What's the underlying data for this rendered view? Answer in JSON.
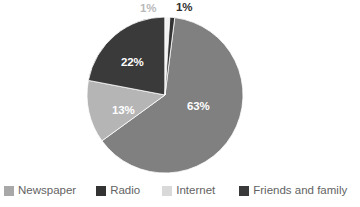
{
  "chart_data": {
    "type": "pie",
    "title": "",
    "subtitle": "",
    "xlabel": "",
    "ylabel": "",
    "grid": false,
    "legend_position": "bottom",
    "categories": [
      "Newspaper",
      "Radio",
      "Internet",
      "Friends and family"
    ],
    "values": [
      63,
      1,
      13,
      22
    ],
    "slice_order_clockwise_from_top": [
      "Newspaper",
      "Internet",
      "Friends and family",
      "Radio",
      "Other"
    ],
    "data_labels": [
      "63%",
      "1%",
      "13%",
      "22%",
      "1%"
    ],
    "colors": [
      "#808080",
      "#333333",
      "#b5b5b5",
      "#3a3a3a"
    ]
  },
  "pie": {
    "center_x": 165,
    "center_y": 95,
    "radius": 78,
    "slices": [
      {
        "name": "Newspaper",
        "percent": 63,
        "label": "63%",
        "color": "#808080",
        "start_deg": 7.2,
        "end_deg": 234.0
      },
      {
        "name": "Internet",
        "percent": 13,
        "label": "13%",
        "color": "#b5b5b5",
        "start_deg": 234.0,
        "end_deg": 280.8
      },
      {
        "name": "Friends and family",
        "percent": 22,
        "label": "22%",
        "color": "#3a3a3a",
        "start_deg": 280.8,
        "end_deg": 360.0
      },
      {
        "name": "Other",
        "percent": 1,
        "label": "1%",
        "color": "#f2f2f2",
        "start_deg": 0.0,
        "end_deg": 3.6
      },
      {
        "name": "Radio",
        "percent": 1,
        "label": "1%",
        "color": "#333333",
        "start_deg": 3.6,
        "end_deg": 7.2
      }
    ],
    "labels": {
      "newspaper": "63%",
      "friends": "22%",
      "internet": "13%",
      "radio_outside": "1%",
      "other_outside": "1%"
    }
  },
  "legend": {
    "items": [
      {
        "label": "Newspaper",
        "color": "#a8a8a8"
      },
      {
        "label": "Radio",
        "color": "#333333"
      },
      {
        "label": "Internet",
        "color": "#d9d9d9"
      },
      {
        "label": "Friends and family",
        "color": "#3a3a3a"
      }
    ]
  }
}
